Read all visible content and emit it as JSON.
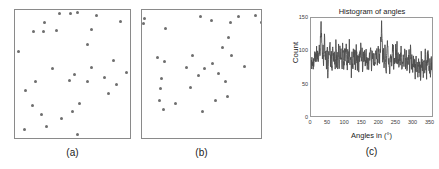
{
  "figure": {
    "background": "#ffffff",
    "dot_color": "#6e6e6e",
    "axis_color": "#8a8a8a",
    "trace_color": "#4d4d4d"
  },
  "panels": [
    {
      "id": "panel-a",
      "caption": "(a)",
      "box": {
        "left": 14,
        "top": 9,
        "width": 117,
        "height": 130
      },
      "points": [
        [
          44,
          3
        ],
        [
          55,
          3
        ],
        [
          62,
          2
        ],
        [
          81,
          5
        ],
        [
          29,
          12
        ],
        [
          105,
          11
        ],
        [
          18,
          21
        ],
        [
          28,
          21
        ],
        [
          41,
          20
        ],
        [
          76,
          19
        ],
        [
          72,
          34
        ],
        [
          3,
          41
        ],
        [
          98,
          50
        ],
        [
          37,
          58
        ],
        [
          76,
          57
        ],
        [
          59,
          64
        ],
        [
          89,
          67
        ],
        [
          111,
          62
        ],
        [
          20,
          71
        ],
        [
          54,
          70
        ],
        [
          72,
          71
        ],
        [
          101,
          74
        ],
        [
          10,
          80
        ],
        [
          93,
          83
        ],
        [
          17,
          95
        ],
        [
          64,
          93
        ],
        [
          26,
          104
        ],
        [
          46,
          108
        ],
        [
          57,
          101
        ],
        [
          31,
          116
        ],
        [
          9,
          119
        ],
        [
          62,
          124
        ]
      ]
    },
    {
      "id": "panel-b",
      "caption": "(b)",
      "box": {
        "left": 141,
        "top": 9,
        "width": 121,
        "height": 130
      },
      "points": [
        [
          2,
          8
        ],
        [
          58,
          6
        ],
        [
          96,
          6
        ],
        [
          113,
          5
        ],
        [
          1,
          13
        ],
        [
          69,
          10
        ],
        [
          88,
          12
        ],
        [
          119,
          12
        ],
        [
          23,
          18
        ],
        [
          86,
          27
        ],
        [
          80,
          37
        ],
        [
          15,
          47
        ],
        [
          50,
          45
        ],
        [
          89,
          45
        ],
        [
          22,
          51
        ],
        [
          44,
          57
        ],
        [
          62,
          58
        ],
        [
          70,
          53
        ],
        [
          102,
          56
        ],
        [
          56,
          65
        ],
        [
          76,
          63
        ],
        [
          19,
          68
        ],
        [
          83,
          71
        ],
        [
          130,
          69
        ],
        [
          18,
          78
        ],
        [
          48,
          77
        ],
        [
          17,
          90
        ],
        [
          85,
          86
        ],
        [
          73,
          90
        ],
        [
          33,
          93
        ],
        [
          21,
          99
        ],
        [
          60,
          101
        ]
      ]
    }
  ],
  "histogram": {
    "title": "Histogram of angles",
    "xlabel": "Angles in (°)",
    "ylabel": "Count",
    "caption": "(c)"
  },
  "chart_data": {
    "type": "line",
    "title": "Histogram of angles",
    "xlabel": "Angles in (°)",
    "ylabel": "Count",
    "xlim": [
      0,
      360
    ],
    "ylim": [
      0,
      150
    ],
    "xticks": [
      0,
      50,
      100,
      150,
      200,
      250,
      300,
      350
    ],
    "yticks": [
      0,
      50,
      100,
      150
    ],
    "grid": false,
    "legend": null,
    "x": [
      0,
      2,
      4,
      6,
      8,
      10,
      12,
      14,
      16,
      18,
      20,
      22,
      24,
      26,
      28,
      30,
      32,
      34,
      36,
      38,
      40,
      42,
      44,
      46,
      48,
      50,
      52,
      54,
      56,
      58,
      60,
      62,
      64,
      66,
      68,
      70,
      72,
      74,
      76,
      78,
      80,
      82,
      84,
      86,
      88,
      90,
      92,
      94,
      96,
      98,
      100,
      102,
      104,
      106,
      108,
      110,
      112,
      114,
      116,
      118,
      120,
      122,
      124,
      126,
      128,
      130,
      132,
      134,
      136,
      138,
      140,
      142,
      144,
      146,
      148,
      150,
      152,
      154,
      156,
      158,
      160,
      162,
      164,
      166,
      168,
      170,
      172,
      174,
      176,
      178,
      180,
      182,
      184,
      186,
      188,
      190,
      192,
      194,
      196,
      198,
      200,
      202,
      204,
      206,
      208,
      210,
      212,
      214,
      216,
      218,
      220,
      222,
      224,
      226,
      228,
      230,
      232,
      234,
      236,
      238,
      240,
      242,
      244,
      246,
      248,
      250,
      252,
      254,
      256,
      258,
      260,
      262,
      264,
      266,
      268,
      270,
      272,
      274,
      276,
      278,
      280,
      282,
      284,
      286,
      288,
      290,
      292,
      294,
      296,
      298,
      300,
      302,
      304,
      306,
      308,
      310,
      312,
      314,
      316,
      318,
      320,
      322,
      324,
      326,
      328,
      330,
      332,
      334,
      336,
      338,
      340,
      342,
      344,
      346,
      348,
      350,
      352,
      354,
      356,
      358,
      360
    ],
    "values": [
      78,
      75,
      82,
      70,
      88,
      79,
      95,
      74,
      104,
      86,
      97,
      78,
      110,
      92,
      120,
      143,
      112,
      88,
      101,
      83,
      118,
      90,
      99,
      76,
      108,
      70,
      96,
      82,
      112,
      86,
      100,
      74,
      93,
      101,
      80,
      98,
      72,
      106,
      84,
      92,
      67,
      99,
      78,
      108,
      86,
      95,
      70,
      103,
      88,
      76,
      99,
      83,
      111,
      90,
      72,
      98,
      80,
      105,
      86,
      94,
      69,
      100,
      77,
      96,
      84,
      90,
      73,
      102,
      88,
      79,
      94,
      71,
      99,
      86,
      104,
      77,
      92,
      68,
      100,
      82,
      95,
      73,
      103,
      87,
      78,
      97,
      70,
      91,
      84,
      99,
      75,
      106,
      88,
      80,
      95,
      72,
      101,
      86,
      93,
      78,
      110,
      90,
      82,
      99,
      115,
      142,
      105,
      88,
      96,
      79,
      103,
      86,
      72,
      98,
      110,
      84,
      93,
      70,
      101,
      88,
      76,
      95,
      107,
      82,
      90,
      73,
      99,
      86,
      104,
      78,
      92,
      70,
      97,
      84,
      100,
      75,
      88,
      95,
      71,
      102,
      86,
      79,
      93,
      68,
      98,
      84,
      90,
      72,
      96,
      80,
      87,
      65,
      93,
      76,
      84,
      61,
      88,
      72,
      80,
      58,
      85,
      68,
      77,
      60,
      90,
      74,
      82,
      66,
      86,
      71,
      93,
      78,
      69,
      84,
      96,
      75,
      70,
      88,
      64,
      82,
      70
    ]
  }
}
